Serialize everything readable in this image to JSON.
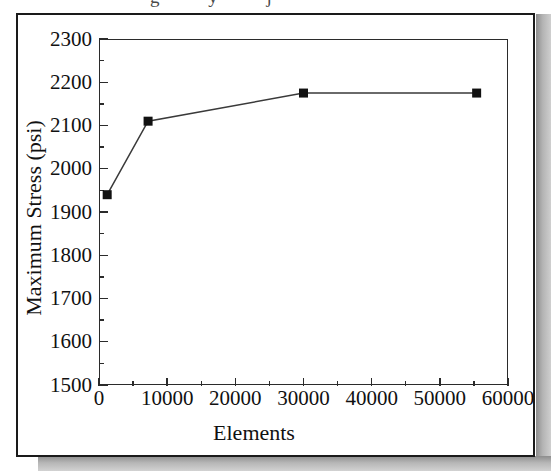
{
  "document": {
    "caption_bleed": "g y j",
    "border_color": "#1a1a1a",
    "shadow_color": "#9a9a9a",
    "background": "#ffffff"
  },
  "chart_data": {
    "type": "line",
    "title": "",
    "subtitle": "",
    "xlabel": "Elements",
    "ylabel": "Maximum Stress (psi)",
    "xlim": [
      0,
      60000
    ],
    "ylim": [
      1500,
      2300
    ],
    "grid": false,
    "legend": null,
    "legend_position": "none",
    "marker": "filled-square",
    "marker_color": "#111111",
    "line_color": "#3a3a3a",
    "x_major_ticks": [
      0,
      10000,
      20000,
      30000,
      40000,
      50000,
      60000
    ],
    "x_minor_interval": 5000,
    "y_major_ticks": [
      1500,
      1600,
      1700,
      1800,
      1900,
      2000,
      2100,
      2200,
      2300
    ],
    "y_minor_interval": 50,
    "x_tick_labels": [
      "0",
      "10000",
      "20000",
      "30000",
      "40000",
      "50000",
      "60000"
    ],
    "y_tick_labels": [
      "1500",
      "1600",
      "1700",
      "1800",
      "1900",
      "2000",
      "2100",
      "2200",
      "2300"
    ],
    "series": [
      {
        "name": "Maximum Stress",
        "x": [
          1200,
          7200,
          30000,
          55400
        ],
        "y": [
          1940,
          2110,
          2175,
          2175
        ]
      }
    ]
  }
}
